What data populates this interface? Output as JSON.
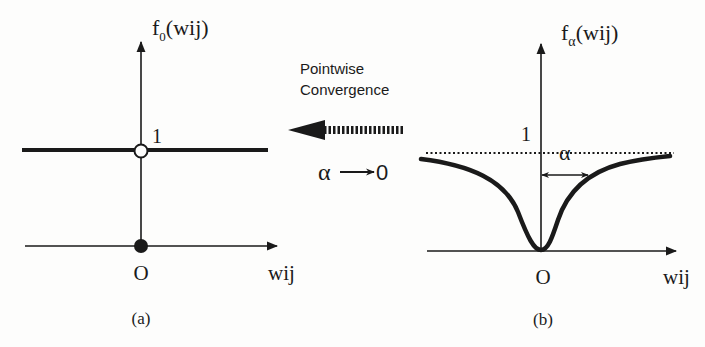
{
  "figure": {
    "panel_a": {
      "y_label": "f",
      "y_label_subscript": "0",
      "y_label_arg": "(wij)",
      "level_label": "1",
      "origin_label": "O",
      "x_label": "wij",
      "caption": "(a)"
    },
    "middle": {
      "line1": "Pointwise",
      "line2": "Convergence",
      "limit_alpha": "α",
      "limit_arrow": "⟶",
      "limit_zero": "0"
    },
    "panel_b": {
      "y_label": "f",
      "y_label_subscript": "α",
      "y_label_arg": "(wij)",
      "level_label": "1",
      "width_label": "α",
      "origin_label": "O",
      "x_label": "wij",
      "caption": "(b)"
    },
    "colors": {
      "ink": "#1a1a1a",
      "background": "#fdfdfc"
    }
  }
}
